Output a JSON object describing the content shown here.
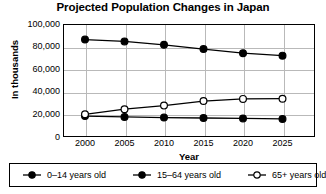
{
  "chart_data": {
    "type": "line",
    "title": "Projected Population Changes in Japan",
    "xlabel": "Year",
    "ylabel": "In thousands",
    "x": [
      2000,
      2005,
      2010,
      2015,
      2020,
      2025
    ],
    "xticklabels": [
      "2000",
      "2005",
      "2010",
      "2015",
      "2020",
      "2025"
    ],
    "yticklabels": [
      "100,000",
      "80,000",
      "60,000",
      "40,000",
      "20,000",
      "0"
    ],
    "yticks": [
      100000,
      80000,
      60000,
      40000,
      20000,
      0
    ],
    "ylim": [
      0,
      100000
    ],
    "grid": true,
    "legend_position": "bottom",
    "series": [
      {
        "name": "0–14 years old",
        "marker": "filled-circle",
        "values": [
          18500,
          17800,
          17200,
          16800,
          16400,
          16000
        ]
      },
      {
        "name": "15–64 years old",
        "marker": "filled-circle",
        "values": [
          86200,
          84600,
          81600,
          77800,
          74200,
          72000
        ]
      },
      {
        "name": "65+ years old",
        "marker": "open-circle",
        "values": [
          20100,
          24600,
          27800,
          31800,
          33700,
          33900
        ]
      }
    ]
  },
  "legend": {
    "entries": [
      {
        "label": "0–14 years old",
        "marker": "filled-circle-line-icon"
      },
      {
        "label": "15–64 years old",
        "marker": "filled-circle-line-icon"
      },
      {
        "label": "65+ years old",
        "marker": "open-circle-line-icon"
      }
    ]
  },
  "colors": {
    "line": "#000000",
    "grid": "#b9b9b9",
    "frame": "#000000",
    "background": "#ffffff"
  }
}
